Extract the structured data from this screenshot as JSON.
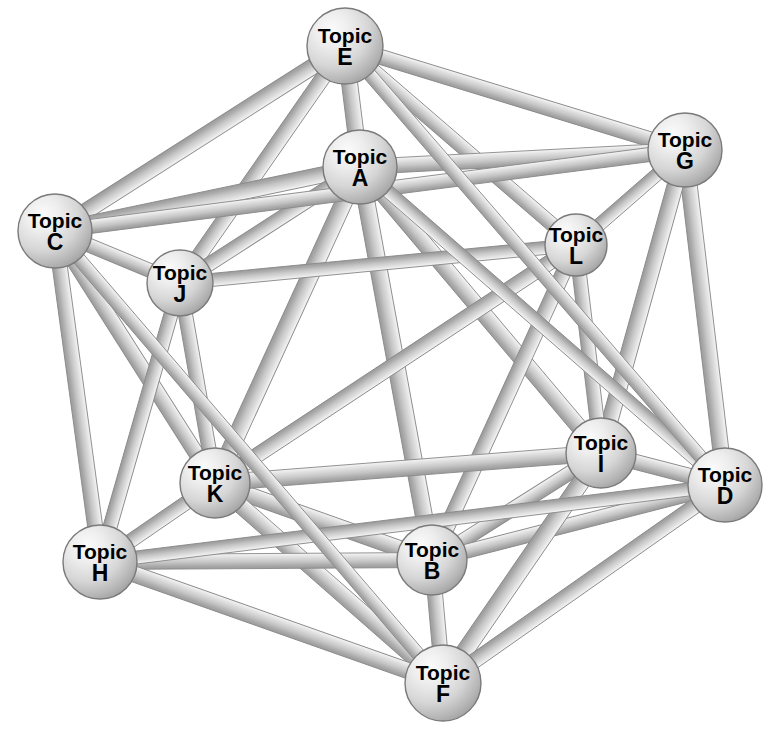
{
  "graph": {
    "title": "Topic Network Graph",
    "layout": "icosahedral",
    "canvas": {
      "width": 773,
      "height": 729
    },
    "style": {
      "background_color": "#ffffff",
      "node_fill_light": "#f2f2f2",
      "node_fill_mid": "#d8d8d8",
      "node_fill_dark": "#a9a9a9",
      "node_stroke_color": "#7a7a7a",
      "node_stroke_width": 1.4,
      "edge_light": "#efefef",
      "edge_mid": "#cccccc",
      "edge_dark": "#9a9a9a",
      "edge_stroke_color": "#8a8a8a",
      "edge_stroke_width": 0.9,
      "label_color": "#000000",
      "label_font_size": 21,
      "label_letter_font_size": 23
    },
    "nodes": [
      {
        "id": "A",
        "label_top": "Topic",
        "label_bottom": "A",
        "x": 360,
        "y": 167,
        "r": 37
      },
      {
        "id": "B",
        "label_top": "Topic",
        "label_bottom": "B",
        "x": 432,
        "y": 560,
        "r": 35
      },
      {
        "id": "C",
        "label_top": "Topic",
        "label_bottom": "C",
        "x": 55,
        "y": 231,
        "r": 37
      },
      {
        "id": "D",
        "label_top": "Topic",
        "label_bottom": "D",
        "x": 725,
        "y": 485,
        "r": 37
      },
      {
        "id": "E",
        "label_top": "Topic",
        "label_bottom": "E",
        "x": 345,
        "y": 46,
        "r": 38
      },
      {
        "id": "F",
        "label_top": "Topic",
        "label_bottom": "F",
        "x": 443,
        "y": 683,
        "r": 38
      },
      {
        "id": "G",
        "label_top": "Topic",
        "label_bottom": "G",
        "x": 685,
        "y": 150,
        "r": 37
      },
      {
        "id": "H",
        "label_top": "Topic",
        "label_bottom": "H",
        "x": 100,
        "y": 562,
        "r": 37
      },
      {
        "id": "I",
        "label_top": "Topic",
        "label_bottom": "I",
        "x": 601,
        "y": 453,
        "r": 35
      },
      {
        "id": "J",
        "label_top": "Topic",
        "label_bottom": "J",
        "x": 180,
        "y": 283,
        "r": 33
      },
      {
        "id": "K",
        "label_top": "Topic",
        "label_bottom": "K",
        "x": 215,
        "y": 483,
        "r": 35
      },
      {
        "id": "L",
        "label_top": "Topic",
        "label_bottom": "L",
        "x": 576,
        "y": 245,
        "r": 31
      }
    ],
    "edges": [
      {
        "from": "E",
        "to": "A",
        "width": 16
      },
      {
        "from": "E",
        "to": "C",
        "width": 16
      },
      {
        "from": "E",
        "to": "G",
        "width": 15
      },
      {
        "from": "E",
        "to": "J",
        "width": 15
      },
      {
        "from": "E",
        "to": "L",
        "width": 14
      },
      {
        "from": "A",
        "to": "C",
        "width": 16
      },
      {
        "from": "A",
        "to": "G",
        "width": 15
      },
      {
        "from": "A",
        "to": "J",
        "width": 14
      },
      {
        "from": "A",
        "to": "B",
        "width": 17
      },
      {
        "from": "A",
        "to": "K",
        "width": 17
      },
      {
        "from": "A",
        "to": "I",
        "width": 16
      },
      {
        "from": "C",
        "to": "J",
        "width": 14
      },
      {
        "from": "C",
        "to": "H",
        "width": 15
      },
      {
        "from": "C",
        "to": "K",
        "width": 15
      },
      {
        "from": "C",
        "to": "G",
        "width": 14
      },
      {
        "from": "G",
        "to": "L",
        "width": 13
      },
      {
        "from": "G",
        "to": "D",
        "width": 16
      },
      {
        "from": "G",
        "to": "I",
        "width": 16
      },
      {
        "from": "L",
        "to": "I",
        "width": 14
      },
      {
        "from": "L",
        "to": "B",
        "width": 15
      },
      {
        "from": "L",
        "to": "K",
        "width": 15
      },
      {
        "from": "L",
        "to": "J",
        "width": 13
      },
      {
        "from": "J",
        "to": "K",
        "width": 14
      },
      {
        "from": "J",
        "to": "H",
        "width": 14
      },
      {
        "from": "K",
        "to": "H",
        "width": 14
      },
      {
        "from": "K",
        "to": "B",
        "width": 16
      },
      {
        "from": "K",
        "to": "F",
        "width": 16
      },
      {
        "from": "K",
        "to": "I",
        "width": 16
      },
      {
        "from": "H",
        "to": "B",
        "width": 15
      },
      {
        "from": "H",
        "to": "F",
        "width": 16
      },
      {
        "from": "B",
        "to": "F",
        "width": 15
      },
      {
        "from": "B",
        "to": "I",
        "width": 14
      },
      {
        "from": "B",
        "to": "D",
        "width": 14
      },
      {
        "from": "I",
        "to": "D",
        "width": 15
      },
      {
        "from": "I",
        "to": "F",
        "width": 17
      },
      {
        "from": "D",
        "to": "F",
        "width": 15
      },
      {
        "from": "D",
        "to": "H",
        "width": 13
      },
      {
        "from": "D",
        "to": "A",
        "width": 13
      },
      {
        "from": "C",
        "to": "F",
        "width": 13
      },
      {
        "from": "E",
        "to": "D",
        "width": 13
      }
    ]
  }
}
